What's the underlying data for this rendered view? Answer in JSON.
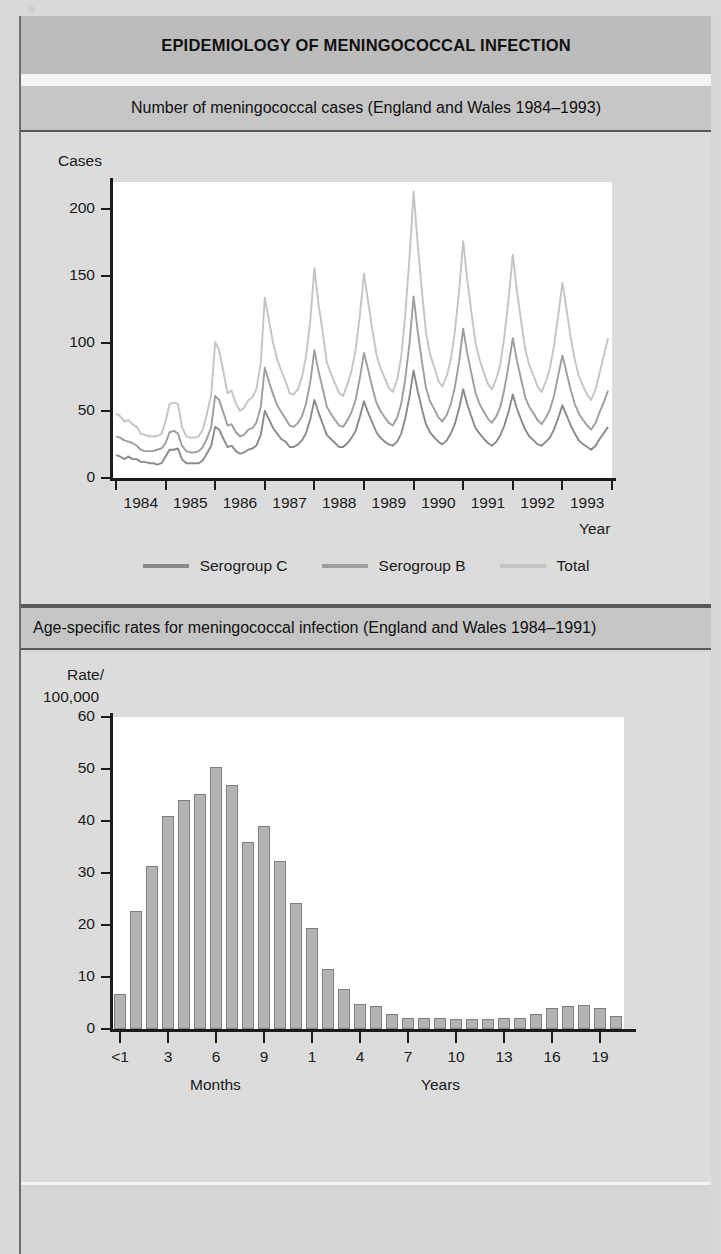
{
  "document": {
    "main_title": "EPIDEMIOLOGY OF MENINGOCOCCAL INFECTION"
  },
  "panel_line": {
    "title": "Number of meningococcal cases (England and Wales 1984–1993)",
    "legend": [
      {
        "label": "Serogroup C",
        "color": "#8a8a8a"
      },
      {
        "label": "Serogroup B",
        "color": "#9e9e9e"
      },
      {
        "label": "Total",
        "color": "#c4c4c4"
      }
    ]
  },
  "panel_bar": {
    "title": "Age-specific rates for meningococcal infection (England and Wales 1984–1991)"
  },
  "chart_data": [
    {
      "type": "line",
      "title": "Number of meningococcal cases (England and Wales 1984–1993)",
      "xlabel": "Year",
      "ylabel": "Cases",
      "ylim": [
        0,
        220
      ],
      "yticks": [
        0,
        50,
        100,
        150,
        200
      ],
      "ytick_labels": [
        "0",
        "50",
        "100",
        "150",
        "200"
      ],
      "xlim": [
        1983.92,
        1994.0
      ],
      "xticks": [
        1984,
        1985,
        1986,
        1987,
        1988,
        1989,
        1990,
        1991,
        1992,
        1993
      ],
      "xtick_labels": [
        "1984",
        "1985",
        "1986",
        "1987",
        "1988",
        "1989",
        "1990",
        "1991",
        "1992",
        "1993"
      ],
      "grid": false,
      "legend_position": "below",
      "x": [
        1984.0,
        1984.08,
        1984.17,
        1984.25,
        1984.33,
        1984.42,
        1984.5,
        1984.58,
        1984.67,
        1984.75,
        1984.83,
        1984.92,
        1985.0,
        1985.08,
        1985.17,
        1985.25,
        1985.33,
        1985.42,
        1985.5,
        1985.58,
        1985.67,
        1985.75,
        1985.83,
        1985.92,
        1986.0,
        1986.08,
        1986.17,
        1986.25,
        1986.33,
        1986.42,
        1986.5,
        1986.58,
        1986.67,
        1986.75,
        1986.83,
        1986.92,
        1987.0,
        1987.08,
        1987.17,
        1987.25,
        1987.33,
        1987.42,
        1987.5,
        1987.58,
        1987.67,
        1987.75,
        1987.83,
        1987.92,
        1988.0,
        1988.08,
        1988.17,
        1988.25,
        1988.33,
        1988.42,
        1988.5,
        1988.58,
        1988.67,
        1988.75,
        1988.83,
        1988.92,
        1989.0,
        1989.08,
        1989.17,
        1989.25,
        1989.33,
        1989.42,
        1989.5,
        1989.58,
        1989.67,
        1989.75,
        1989.83,
        1989.92,
        1990.0,
        1990.08,
        1990.17,
        1990.25,
        1990.33,
        1990.42,
        1990.5,
        1990.58,
        1990.67,
        1990.75,
        1990.83,
        1990.92,
        1991.0,
        1991.08,
        1991.17,
        1991.25,
        1991.33,
        1991.42,
        1991.5,
        1991.58,
        1991.67,
        1991.75,
        1991.83,
        1991.92,
        1992.0,
        1992.08,
        1992.17,
        1992.25,
        1992.33,
        1992.42,
        1992.5,
        1992.58,
        1992.67,
        1992.75,
        1992.83,
        1992.92,
        1993.0,
        1993.08,
        1993.17,
        1993.25,
        1993.33,
        1993.42,
        1993.5,
        1993.58,
        1993.67,
        1993.75,
        1993.83,
        1993.92
      ],
      "series": [
        {
          "name": "Total",
          "color": "#c4c4c4",
          "values": [
            48,
            46,
            42,
            43,
            40,
            38,
            33,
            32,
            31,
            31,
            31,
            33,
            42,
            55,
            56,
            55,
            38,
            31,
            30,
            30,
            31,
            36,
            47,
            62,
            101,
            95,
            78,
            63,
            65,
            55,
            50,
            52,
            58,
            60,
            66,
            86,
            134,
            118,
            100,
            88,
            80,
            72,
            63,
            62,
            66,
            75,
            90,
            118,
            156,
            130,
            108,
            86,
            78,
            70,
            63,
            61,
            70,
            80,
            95,
            122,
            152,
            132,
            110,
            92,
            82,
            74,
            67,
            64,
            73,
            90,
            120,
            165,
            213,
            175,
            138,
            108,
            92,
            82,
            72,
            68,
            76,
            88,
            108,
            140,
            176,
            148,
            122,
            100,
            88,
            78,
            70,
            66,
            74,
            85,
            105,
            135,
            166,
            140,
            116,
            96,
            84,
            76,
            68,
            64,
            72,
            82,
            98,
            122,
            145,
            126,
            104,
            88,
            76,
            68,
            62,
            58,
            66,
            78,
            90,
            104
          ]
        },
        {
          "name": "Serogroup B",
          "color": "#9e9e9e",
          "values": [
            31,
            30,
            28,
            27,
            26,
            24,
            21,
            20,
            20,
            20,
            21,
            22,
            26,
            34,
            35,
            33,
            24,
            20,
            19,
            19,
            20,
            23,
            29,
            38,
            61,
            58,
            48,
            39,
            40,
            34,
            31,
            32,
            36,
            37,
            41,
            53,
            82,
            72,
            62,
            54,
            49,
            44,
            39,
            38,
            41,
            46,
            55,
            72,
            95,
            80,
            66,
            53,
            48,
            43,
            39,
            38,
            43,
            49,
            58,
            75,
            93,
            81,
            67,
            56,
            50,
            45,
            41,
            39,
            45,
            55,
            73,
            101,
            135,
            110,
            86,
            67,
            57,
            51,
            45,
            42,
            47,
            55,
            67,
            87,
            111,
            93,
            77,
            63,
            55,
            49,
            44,
            41,
            46,
            53,
            66,
            85,
            104,
            88,
            73,
            60,
            53,
            48,
            43,
            40,
            45,
            51,
            61,
            77,
            91,
            79,
            65,
            55,
            48,
            43,
            39,
            36,
            41,
            49,
            56,
            65
          ]
        },
        {
          "name": "Serogroup C",
          "color": "#8a8a8a",
          "values": [
            17,
            16,
            14,
            16,
            14,
            14,
            12,
            12,
            11,
            11,
            10,
            11,
            16,
            21,
            21,
            22,
            14,
            11,
            11,
            11,
            11,
            13,
            18,
            24,
            38,
            36,
            29,
            23,
            24,
            20,
            18,
            19,
            21,
            22,
            24,
            32,
            50,
            44,
            37,
            33,
            29,
            27,
            23,
            23,
            25,
            28,
            33,
            44,
            58,
            49,
            40,
            32,
            29,
            26,
            23,
            23,
            26,
            30,
            35,
            46,
            57,
            49,
            41,
            34,
            30,
            27,
            25,
            24,
            27,
            33,
            44,
            61,
            80,
            65,
            51,
            40,
            34,
            30,
            27,
            25,
            28,
            33,
            40,
            52,
            66,
            55,
            45,
            37,
            33,
            29,
            26,
            24,
            27,
            32,
            39,
            50,
            62,
            52,
            43,
            36,
            31,
            28,
            25,
            24,
            27,
            30,
            36,
            45,
            54,
            47,
            39,
            33,
            28,
            25,
            23,
            21,
            24,
            29,
            33,
            38
          ]
        }
      ]
    },
    {
      "type": "bar",
      "title": "Age-specific rates for meningococcal infection (England and Wales 1984–1991)",
      "ylabel": "Rate/ 100,000",
      "ylabel_line1": "Rate/",
      "ylabel_line2": "100,000",
      "ylim": [
        0,
        60
      ],
      "yticks": [
        0,
        10,
        20,
        30,
        40,
        50,
        60
      ],
      "ytick_labels": [
        "0",
        "10",
        "20",
        "30",
        "40",
        "50",
        "60"
      ],
      "grid": false,
      "group_labels": [
        "Months",
        "Years"
      ],
      "xtick_labels": [
        "<1",
        "3",
        "6",
        "9",
        "1",
        "4",
        "7",
        "10",
        "13",
        "16",
        "19"
      ],
      "categories": [
        "<1",
        "1",
        "2",
        "3",
        "4",
        "5",
        "6",
        "7",
        "8",
        "9",
        "10",
        "11",
        "1",
        "2",
        "3",
        "4",
        "5",
        "6",
        "7",
        "8",
        "9",
        "10",
        "11",
        "12",
        "13",
        "14",
        "15",
        "16",
        "17",
        "18",
        "19",
        "20"
      ],
      "values": [
        6.8,
        22.7,
        31.3,
        41.0,
        44.0,
        45.2,
        50.4,
        47.0,
        36.0,
        39.0,
        32.4,
        24.3,
        19.4,
        11.5,
        7.6,
        4.9,
        4.4,
        2.9,
        2.2,
        2.1,
        2.1,
        2.0,
        2.0,
        2.0,
        2.1,
        2.1,
        2.9,
        4.1,
        4.5,
        4.6,
        4.0,
        2.5
      ]
    }
  ]
}
